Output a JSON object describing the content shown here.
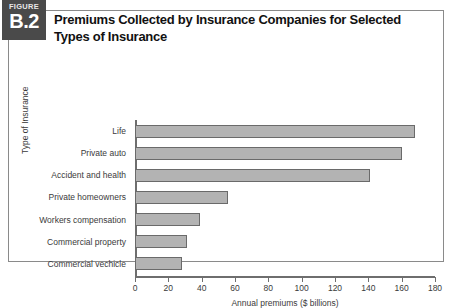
{
  "figure": {
    "badge_kicker": "FIGURE",
    "badge_number": "B.2",
    "title": "Premiums Collected by Insurance Companies for Selected Types of Insurance"
  },
  "colors": {
    "badge_background": "#4a4a4a",
    "badge_text": "#ffffff",
    "bar_fill": "#b3b3b3",
    "bar_border": "#6a6a6a",
    "axis": "#6e6e6e",
    "frame_border": "#8a8a8a",
    "text": "#3a3a3a"
  },
  "chart_data": {
    "type": "bar",
    "orientation": "horizontal",
    "title": "Premiums Collected by Insurance Companies for Selected Types of Insurance",
    "xlabel": "Annual premiums ($ billions)",
    "ylabel": "Type of Insurance",
    "categories": [
      "Commercial vechicle",
      "Commercial property",
      "Workers compensation",
      "Private homeowners",
      "Accident and health",
      "Private auto",
      "Life"
    ],
    "values": [
      28,
      31,
      39,
      56,
      141,
      160,
      168
    ],
    "xlim": [
      0,
      180
    ],
    "xticks": [
      0,
      20,
      40,
      60,
      80,
      100,
      120,
      140,
      160,
      180
    ],
    "grid": false,
    "legend": false
  }
}
